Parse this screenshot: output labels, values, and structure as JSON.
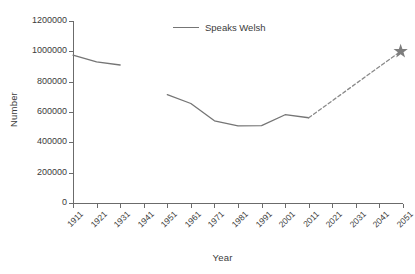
{
  "chart_data": {
    "type": "line",
    "title": "",
    "xlabel": "Year",
    "ylabel": "Number",
    "xlim": [
      1911,
      2051
    ],
    "ylim": [
      0,
      1200000
    ],
    "grid": false,
    "legend_position": "top-center",
    "x_tick_labels": [
      "1911",
      "1921",
      "1931",
      "1941",
      "1951",
      "1961",
      "1971",
      "1981",
      "1991",
      "2001",
      "2011",
      "2021",
      "2031",
      "2041",
      "2051"
    ],
    "y_tick_labels": [
      "0",
      "200000",
      "400000",
      "600000",
      "800000",
      "1000000",
      "1200000"
    ],
    "y_tick_values": [
      0,
      200000,
      400000,
      600000,
      800000,
      1000000,
      1200000
    ],
    "series": [
      {
        "name": "Speaks Welsh",
        "style": "solid",
        "color": "#757575",
        "segments": [
          {
            "note": "early censuses",
            "x": [
              1911,
              1921,
              1931
            ],
            "values": [
              975000,
              930000,
              910000
            ]
          },
          {
            "note": "post-war censuses",
            "x": [
              1951,
              1961,
              1971,
              1981,
              1991,
              2001,
              2011
            ],
            "values": [
              714000,
              656000,
              542000,
              508000,
              510000,
              582000,
              562000
            ]
          }
        ]
      },
      {
        "name": "Projection to target",
        "style": "dashed",
        "color": "#8a8a8a",
        "x": [
          2011,
          2050
        ],
        "values": [
          562000,
          1000000
        ]
      }
    ],
    "markers": [
      {
        "name": "target-star",
        "shape": "star",
        "color": "#7d7d7d",
        "x": 2050,
        "y": 1000000
      }
    ]
  },
  "legend": {
    "entries": [
      {
        "label": "Speaks Welsh",
        "color": "#757575"
      }
    ]
  },
  "axes": {
    "x_title": "Year",
    "y_title": "Number"
  }
}
